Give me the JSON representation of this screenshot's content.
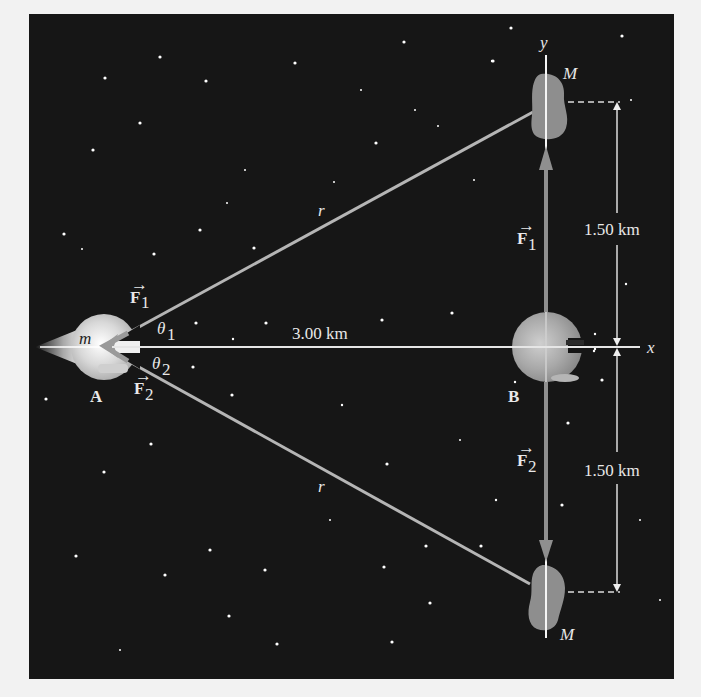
{
  "diagram": {
    "background_color": "#f2f2f2",
    "panel_color": "#161616",
    "axes": {
      "x_label": "x",
      "y_label": "y"
    },
    "objects": {
      "ship_a": {
        "label": "A",
        "mass_label": "m"
      },
      "ship_b": {
        "label": "B"
      },
      "asteroid_top": {
        "label": "M"
      },
      "asteroid_bottom": {
        "label": "M"
      }
    },
    "forces": {
      "at_a": [
        {
          "symbol": "F",
          "subscript": "1"
        },
        {
          "symbol": "F",
          "subscript": "2"
        }
      ],
      "at_b": [
        {
          "symbol": "F",
          "subscript": "1"
        },
        {
          "symbol": "F",
          "subscript": "2"
        }
      ]
    },
    "angles": [
      {
        "symbol": "θ",
        "subscript": "1"
      },
      {
        "symbol": "θ",
        "subscript": "2"
      }
    ],
    "distances": {
      "r_top": "r",
      "r_bottom": "r",
      "horizontal": "3.00 km",
      "vertical_top": "1.50 km",
      "vertical_bottom": "1.50 km"
    }
  }
}
